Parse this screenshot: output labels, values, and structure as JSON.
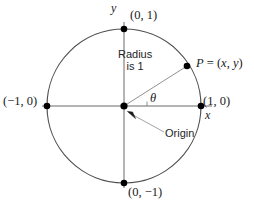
{
  "figure": {
    "background_color": "#ffffff",
    "stroke_color": "#4d4d4d",
    "point_color": "#000000",
    "text_color": "#1a1a1a"
  },
  "geometry": {
    "center_x": 124,
    "center_y": 106,
    "radius": 77,
    "x_axis_start": 42,
    "x_axis_end": 212,
    "y_axis_start": 22,
    "y_axis_end": 188,
    "point_p_x": 187,
    "point_p_y": 66,
    "angle_degrees": 32
  },
  "labels": {
    "y_axis": "y",
    "x_axis": "x",
    "top_point": "(0, 1)",
    "bottom_point": "(0, −1)",
    "left_point": "(−1, 0)",
    "right_point": "(1, 0)",
    "radius_line1": "Radius",
    "radius_line2": "is 1",
    "angle": "θ",
    "origin": "Origin",
    "point_p_prefix": "P",
    "point_p_equals": " = (",
    "point_p_x_var": "x",
    "point_p_comma": ", ",
    "point_p_y_var": "y",
    "point_p_close": ")"
  }
}
